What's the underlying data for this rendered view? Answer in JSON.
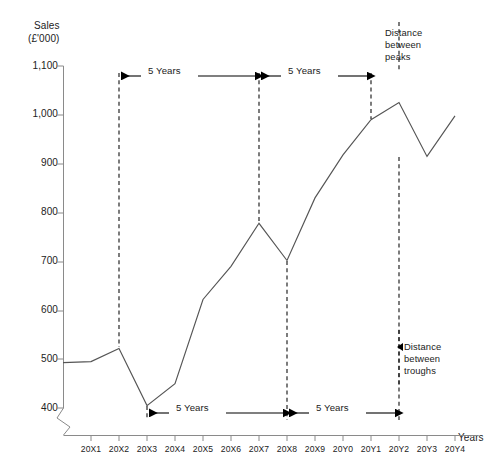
{
  "chart_data": {
    "type": "line",
    "title": "",
    "ylabel": "Sales (£'000)",
    "ylabel_line1": "Sales",
    "ylabel_line2": "(£'000)",
    "xlabel": "Years",
    "categories": [
      "20X1",
      "20X2",
      "20X3",
      "20X4",
      "20X5",
      "20X6",
      "20X7",
      "20X8",
      "20X9",
      "20Y0",
      "20Y1",
      "20Y2",
      "20Y3",
      "20Y4"
    ],
    "values": [
      495,
      522,
      405,
      450,
      622,
      690,
      778,
      702,
      830,
      918,
      990,
      1025,
      915,
      998
    ],
    "series": [
      {
        "name": "Sales",
        "values": [
          495,
          522,
          405,
          450,
          622,
          690,
          778,
          702,
          830,
          918,
          990,
          1025,
          915,
          998
        ]
      }
    ],
    "ylim": [
      400,
      1100
    ],
    "yticks": [
      400,
      500,
      600,
      700,
      800,
      900,
      1000,
      1100
    ],
    "ytick_labels": [
      "400",
      "500",
      "600",
      "700",
      "800",
      "900",
      "1,000",
      "1,100"
    ],
    "axis_break": true,
    "axis_break_note": "y-axis broken below 400",
    "grid": false,
    "legend": "none",
    "line_color": "#555555",
    "annotation_color": "#000000"
  },
  "annotations": {
    "interval_label": "5 Years",
    "peaks_note": "Distance\nbetween\npeaks",
    "peaks_note_lines": [
      "Distance",
      "between",
      "peaks"
    ],
    "troughs_note": "Distance\nbetween\ntroughs",
    "troughs_note_lines": [
      "Distance",
      "between",
      "troughs"
    ],
    "peak_markers": [
      "20X2",
      "20X7",
      "20Y2"
    ],
    "trough_markers": [
      "20X3",
      "20X8",
      "20Y3"
    ],
    "top_spans": [
      {
        "from": "20X2",
        "to": "20X7",
        "label": "5 Years"
      },
      {
        "from": "20X7",
        "to": "20Y2",
        "label": "5 Years"
      }
    ],
    "bottom_spans": [
      {
        "from": "20X3",
        "to": "20X8",
        "label": "5 Years"
      },
      {
        "from": "20X8",
        "to": "20Y3",
        "label": "5 Years"
      }
    ]
  },
  "faint_header": ""
}
